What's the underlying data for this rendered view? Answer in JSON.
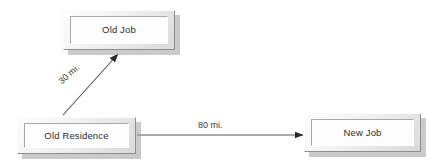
{
  "diagram": {
    "background_color": "#ffffff",
    "line_color": "#555555",
    "text_color": "#2e2e2e",
    "nodes": [
      {
        "id": "old-job",
        "label": "Old Job"
      },
      {
        "id": "old-residence",
        "label": "Old Residence"
      },
      {
        "id": "new-job",
        "label": "New Job"
      }
    ],
    "edges": [
      {
        "id": "residence-to-old-job",
        "label": "30 mi.",
        "from": "old-residence",
        "to": "old-job",
        "arrow": "single"
      },
      {
        "id": "residence-to-new-job",
        "label": "80 mi.",
        "from": "old-residence",
        "to": "new-job",
        "arrow": "single"
      }
    ]
  }
}
